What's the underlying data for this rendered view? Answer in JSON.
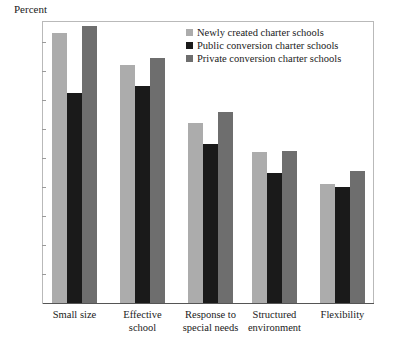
{
  "chart_data": {
    "type": "bar",
    "title": "",
    "ylabel": "Percent",
    "xlabel": "",
    "ylim": [
      0,
      100
    ],
    "yticks": [
      10,
      20,
      30,
      40,
      50,
      60,
      70,
      80,
      90
    ],
    "grid": false,
    "legend_position": "top-right",
    "categories": [
      "Small size",
      "Effective\nschool",
      "Response to\nspecial needs",
      "Structured\nenvironment",
      "Flexibility"
    ],
    "series": [
      {
        "name": "Newly created charter schools",
        "color": "#acacac",
        "values": [
          93,
          82,
          62,
          52,
          41
        ]
      },
      {
        "name": "Public conversion charter schools",
        "color": "#1a1a1a",
        "values": [
          72.5,
          75,
          55,
          45,
          40
        ]
      },
      {
        "name": "Private conversion charter schools",
        "color": "#6e6e6e",
        "values": [
          95.5,
          84.5,
          66,
          52.5,
          45.5
        ]
      }
    ]
  },
  "axis": {
    "y_title": "Percent"
  }
}
